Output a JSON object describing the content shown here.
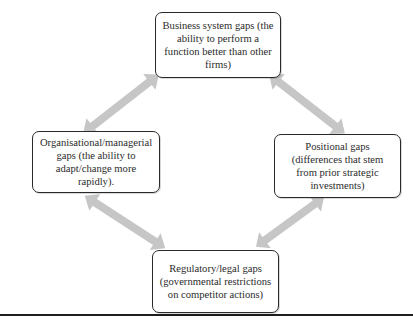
{
  "diagram": {
    "type": "cycle-of-gaps",
    "nodes": [
      {
        "id": "business",
        "position": "top",
        "lines": [
          "Business system gaps (the",
          "ability to perform a",
          "function better than other",
          "firms)"
        ]
      },
      {
        "id": "organisational",
        "position": "left",
        "lines": [
          "Organisational/managerial",
          "gaps (the ability to",
          "adapt/change more",
          "rapidly)."
        ]
      },
      {
        "id": "positional",
        "position": "right",
        "lines": [
          "Positional gaps",
          "(differences that stem",
          "from prior strategic",
          "investments)"
        ]
      },
      {
        "id": "regulatory",
        "position": "bottom",
        "lines": [
          "Regulatory/legal gaps",
          "(governmental restrictions",
          "on competitor actions)"
        ]
      }
    ],
    "edges": [
      {
        "from": "business",
        "to": "organisational",
        "style": "double-headed-arrow"
      },
      {
        "from": "business",
        "to": "positional",
        "style": "double-headed-arrow"
      },
      {
        "from": "organisational",
        "to": "regulatory",
        "style": "double-headed-arrow"
      },
      {
        "from": "positional",
        "to": "regulatory",
        "style": "double-headed-arrow"
      }
    ],
    "colors": {
      "arrow": "#c4c4c4",
      "box_border": "#2a2a2a",
      "text": "#2b2b2b",
      "rule": "#1e1e1e"
    }
  }
}
